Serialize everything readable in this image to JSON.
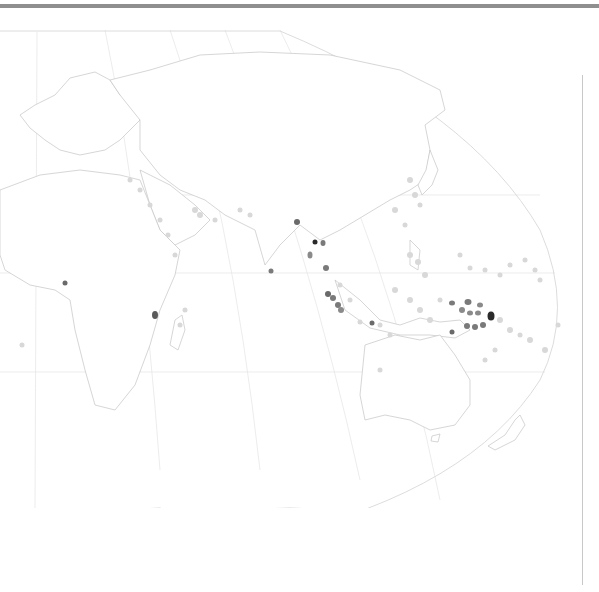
{
  "map": {
    "projection": "robinson-like, centered on Indian Ocean / Asia",
    "style": "grayscale choropleth-free country outlines with point markers",
    "colors": {
      "background": "#ffffff",
      "country_stroke": "#c4c4c4",
      "graticule": "#e4e4e4",
      "point_light": "#d6d6d6",
      "point_mid": "#8a8a8a",
      "point_dark": "#3a3a3a",
      "top_bar": "#8f8f8f"
    },
    "regions_visible": [
      "Europe",
      "Africa",
      "Middle East",
      "Russia",
      "Central Asia",
      "South Asia",
      "China",
      "Japan",
      "Southeast Asia",
      "Indonesia",
      "Papua New Guinea",
      "Australia",
      "New Zealand",
      "Antarctica"
    ],
    "points": [
      {
        "x": 65,
        "y": 283,
        "shade": "mid"
      },
      {
        "x": 155,
        "y": 315,
        "shade": "mid"
      },
      {
        "x": 271,
        "y": 271,
        "shade": "mid"
      },
      {
        "x": 297,
        "y": 222,
        "shade": "mid"
      },
      {
        "x": 315,
        "y": 242,
        "shade": "dark"
      },
      {
        "x": 323,
        "y": 243,
        "shade": "mid"
      },
      {
        "x": 310,
        "y": 255,
        "shade": "mid"
      },
      {
        "x": 326,
        "y": 268,
        "shade": "mid"
      },
      {
        "x": 328,
        "y": 294,
        "shade": "mid"
      },
      {
        "x": 333,
        "y": 298,
        "shade": "mid"
      },
      {
        "x": 338,
        "y": 305,
        "shade": "mid"
      },
      {
        "x": 341,
        "y": 310,
        "shade": "mid"
      },
      {
        "x": 372,
        "y": 323,
        "shade": "mid"
      },
      {
        "x": 452,
        "y": 303,
        "shade": "mid"
      },
      {
        "x": 468,
        "y": 302,
        "shade": "mid"
      },
      {
        "x": 480,
        "y": 305,
        "shade": "mid"
      },
      {
        "x": 462,
        "y": 310,
        "shade": "mid"
      },
      {
        "x": 470,
        "y": 313,
        "shade": "mid"
      },
      {
        "x": 478,
        "y": 313,
        "shade": "mid"
      },
      {
        "x": 490,
        "y": 316,
        "shade": "dark"
      },
      {
        "x": 467,
        "y": 326,
        "shade": "mid"
      },
      {
        "x": 475,
        "y": 327,
        "shade": "mid"
      },
      {
        "x": 483,
        "y": 325,
        "shade": "mid"
      },
      {
        "x": 452,
        "y": 332,
        "shade": "mid"
      }
    ],
    "light_points_note": "many faint light-gray markers along Red Sea, Persian Gulf, Japan, Philippines, Indonesia, Pacific islands"
  }
}
